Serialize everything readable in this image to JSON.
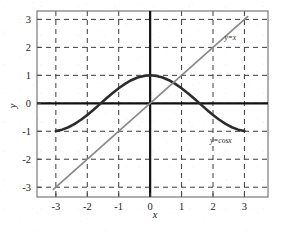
{
  "chart_data": {
    "type": "line",
    "title": "",
    "subtitle": "",
    "xlabel": "x",
    "ylabel": "y",
    "xlim": [
      -3.6,
      3.75
    ],
    "ylim": [
      -3.35,
      3.3
    ],
    "xticks": [
      -3,
      -2,
      -1,
      0,
      1,
      2,
      3
    ],
    "xtick_labels": [
      "-3",
      "-2",
      "-1",
      "0",
      "1",
      "2",
      "3"
    ],
    "yticks": [
      3,
      2,
      1,
      0,
      -1,
      -2,
      -3
    ],
    "ytick_labels": [
      "3",
      "2",
      "1",
      "0",
      "-1",
      "-2",
      "-3"
    ],
    "grid": true,
    "grid_style": "dashed",
    "grid_color": "#3a3a4a",
    "legend": "none",
    "annotations": [
      {
        "name": "line-label-identity",
        "text": "y=x",
        "x": 2.55,
        "y": 2.25
      },
      {
        "name": "line-label-cosine",
        "text": "y=cosx",
        "x": 2.25,
        "y": -1.42
      }
    ],
    "series": [
      {
        "name": "y=cosx",
        "label": "y=cosx",
        "type": "line",
        "color": "#2c2c2c",
        "linewidth": 2.6,
        "x": [
          -3,
          -2.8,
          -2.6,
          -2.4,
          -2.2,
          -2,
          -1.8,
          -1.6,
          -1.4,
          -1.2,
          -1,
          -0.8,
          -0.6,
          -0.4,
          -0.2,
          0,
          0.2,
          0.4,
          0.6,
          0.8,
          1,
          1.2,
          1.4,
          1.6,
          1.8,
          2,
          2.2,
          2.4,
          2.6,
          2.8,
          3
        ],
        "values": [
          -0.99,
          -0.942,
          -0.857,
          -0.737,
          -0.589,
          -0.416,
          -0.227,
          -0.029,
          0.17,
          0.362,
          0.54,
          0.697,
          0.825,
          0.921,
          0.98,
          1,
          0.98,
          0.921,
          0.825,
          0.697,
          0.54,
          0.362,
          0.17,
          -0.029,
          -0.227,
          -0.416,
          -0.589,
          -0.737,
          -0.857,
          -0.942,
          -0.99
        ]
      },
      {
        "name": "y=x",
        "label": "y=x",
        "type": "line",
        "color": "#8a8a8a",
        "linewidth": 1.7,
        "x": [
          -3.08,
          3.1
        ],
        "values": [
          -3.08,
          3.1
        ]
      }
    ],
    "axis_lines": {
      "x_axis_y": 0,
      "y_axis_x": 0,
      "color": "#111111",
      "linewidth": 2.2
    },
    "frame": {
      "color": "#7a7a7a",
      "linewidth": 1.2
    }
  }
}
